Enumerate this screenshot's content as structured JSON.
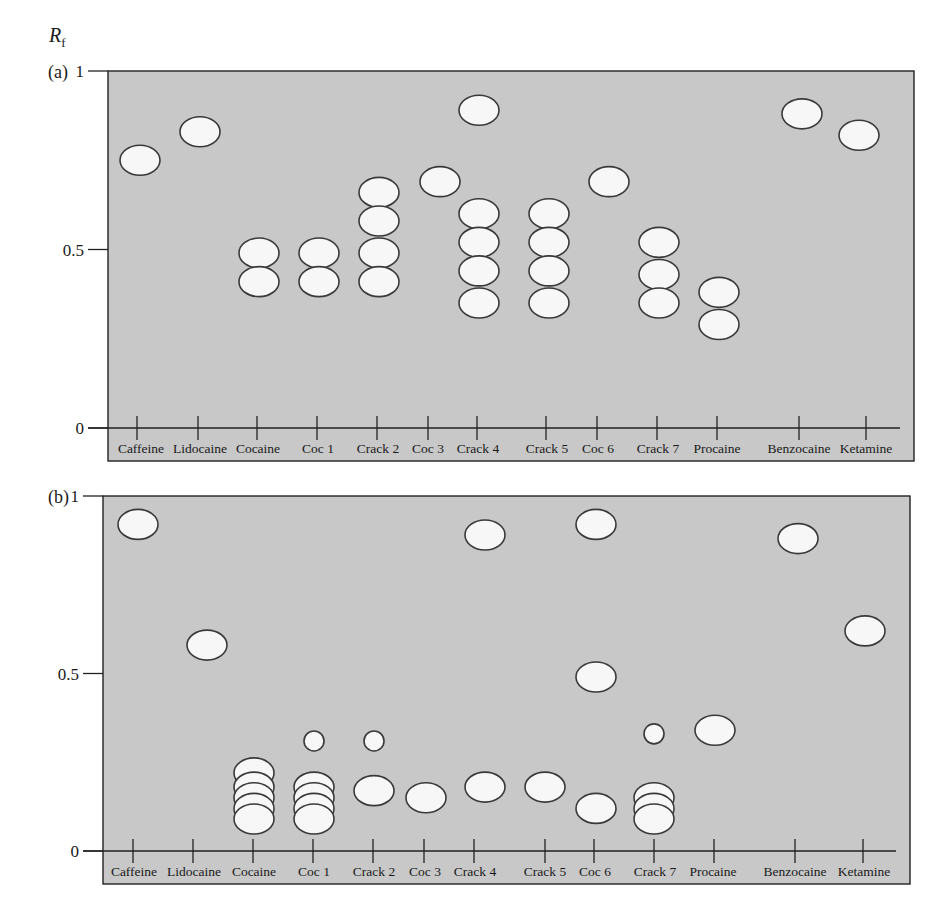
{
  "figure": {
    "y_axis_symbol": "R",
    "y_axis_subscript": "f",
    "panels": [
      {
        "label": "(a)"
      },
      {
        "label": "(b)"
      }
    ],
    "y_ticks": [
      "1",
      "0.5",
      "0"
    ],
    "colors": {
      "plate_background": "#c8c8c8",
      "spot_fill": "#f7f7f7",
      "spot_outline": "#3a3a3a",
      "axis": "#222222"
    }
  },
  "chart_data": [
    {
      "type": "scatter",
      "title": "(a)",
      "subtitle": "TLC plate — Rf values of spots per sample",
      "xlabel": "",
      "ylabel": "Rf",
      "ylim": [
        0,
        1
      ],
      "yticks": [
        0,
        0.5,
        1
      ],
      "grid": false,
      "categories": [
        "Caffeine",
        "Lidocaine",
        "Cocaine",
        "Coc 1",
        "Crack 2",
        "Coc 3",
        "Crack 4",
        "Crack 5",
        "Coc 6",
        "Crack 7",
        "Procaine",
        "Benzocaine",
        "Ketamine"
      ],
      "spots": [
        {
          "lane": "Caffeine",
          "rf": [
            0.75
          ]
        },
        {
          "lane": "Lidocaine",
          "rf": [
            0.83
          ]
        },
        {
          "lane": "Cocaine",
          "rf": [
            0.49,
            0.41
          ]
        },
        {
          "lane": "Coc 1",
          "rf": [
            0.49,
            0.41
          ]
        },
        {
          "lane": "Crack 2",
          "rf": [
            0.66,
            0.58,
            0.49,
            0.41
          ]
        },
        {
          "lane": "Coc 3",
          "rf": [
            0.69
          ]
        },
        {
          "lane": "Crack 4",
          "rf": [
            0.89,
            0.6,
            0.52,
            0.44,
            0.35
          ]
        },
        {
          "lane": "Crack 5",
          "rf": [
            0.6,
            0.52,
            0.44,
            0.35
          ]
        },
        {
          "lane": "Coc 6",
          "rf": [
            0.69
          ]
        },
        {
          "lane": "Crack 7",
          "rf": [
            0.52,
            0.43,
            0.35
          ]
        },
        {
          "lane": "Procaine",
          "rf": [
            0.38,
            0.29
          ]
        },
        {
          "lane": "Benzocaine",
          "rf": [
            0.88
          ]
        },
        {
          "lane": "Ketamine",
          "rf": [
            0.82
          ]
        }
      ]
    },
    {
      "type": "scatter",
      "title": "(b)",
      "subtitle": "TLC plate — Rf values of spots per sample",
      "xlabel": "",
      "ylabel": "Rf",
      "ylim": [
        0,
        1
      ],
      "yticks": [
        0,
        0.5,
        1
      ],
      "grid": false,
      "categories": [
        "Caffeine",
        "Lidocaine",
        "Cocaine",
        "Coc 1",
        "Crack 2",
        "Coc 3",
        "Crack 4",
        "Crack 5",
        "Coc 6",
        "Crack 7",
        "Procaine",
        "Benzocaine",
        "Ketamine"
      ],
      "spots": [
        {
          "lane": "Caffeine",
          "rf": [
            0.92
          ]
        },
        {
          "lane": "Lidocaine",
          "rf": [
            0.58
          ]
        },
        {
          "lane": "Cocaine",
          "rf": [
            0.22,
            0.18,
            0.15,
            0.12,
            0.09
          ],
          "note": "overlapping stacked spots"
        },
        {
          "lane": "Coc 1",
          "rf": [
            0.31,
            0.18,
            0.15,
            0.12,
            0.09
          ],
          "note": "small spot at 0.31 plus overlapping stack"
        },
        {
          "lane": "Crack 2",
          "rf": [
            0.31,
            0.17
          ],
          "note": "small spot at 0.31"
        },
        {
          "lane": "Coc 3",
          "rf": [
            0.15
          ]
        },
        {
          "lane": "Crack 4",
          "rf": [
            0.89,
            0.18
          ]
        },
        {
          "lane": "Crack 5",
          "rf": [
            0.18
          ]
        },
        {
          "lane": "Coc 6",
          "rf": [
            0.92,
            0.49,
            0.12
          ]
        },
        {
          "lane": "Crack 7",
          "rf": [
            0.33,
            0.15,
            0.12,
            0.09
          ],
          "note": "small spot at 0.33 plus overlapping stack"
        },
        {
          "lane": "Procaine",
          "rf": [
            0.34
          ]
        },
        {
          "lane": "Benzocaine",
          "rf": [
            0.88
          ]
        },
        {
          "lane": "Ketamine",
          "rf": [
            0.62
          ]
        }
      ]
    }
  ],
  "layout": {
    "panels": [
      {
        "plate": {
          "x": 108,
          "y": 71,
          "w": 806,
          "h": 390
        },
        "y0": 428,
        "y1": 71,
        "baseline": 428,
        "label_y": 453,
        "label_x": 62,
        "label_text_y": 78,
        "tick_xs": [
          137,
          198,
          257,
          317,
          377,
          428,
          477,
          546,
          597,
          657,
          717,
          799,
          866
        ],
        "label_xs": [
          141,
          200,
          258,
          318,
          378,
          428,
          478,
          547,
          598,
          658,
          717,
          799,
          866
        ],
        "spot_xs": [
          140,
          200,
          259,
          319,
          379,
          440,
          479,
          549,
          609,
          659,
          719,
          802,
          859
        ],
        "small_spot_rx": 0,
        "spot_rx": 20,
        "spot_ry": 15
      },
      {
        "plate": {
          "x": 103,
          "y": 496,
          "w": 807,
          "h": 388
        },
        "y0": 851,
        "y1": 496,
        "baseline": 851,
        "label_y": 876,
        "label_x": 62,
        "label_text_y": 503,
        "tick_xs": [
          133,
          193,
          253,
          313,
          373,
          424,
          474,
          545,
          594,
          654,
          714,
          795,
          863
        ],
        "label_xs": [
          134,
          194,
          254,
          314,
          374,
          425,
          475,
          545,
          595,
          655,
          713,
          795,
          864
        ],
        "spot_xs": [
          138,
          207,
          254,
          314,
          374,
          426,
          485,
          545,
          596,
          654,
          715,
          798,
          865
        ],
        "spot_rx": 20,
        "spot_ry": 15
      }
    ]
  }
}
